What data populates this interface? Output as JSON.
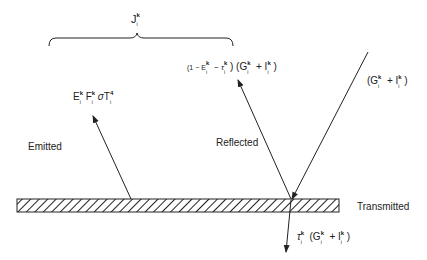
{
  "diagram": {
    "brace_label": {
      "base": "J",
      "sup": "k",
      "sub": "i"
    },
    "labels": {
      "emitted": "Emitted",
      "reflected": "Reflected",
      "transmitted": "Transmitted"
    },
    "expressions": {
      "emitted": "E_i^k F_i^k σ T_i^4",
      "reflected": "(1 − E_i^k − τ_i^k) (G_i^k + I_i^k)",
      "incident": "(G_i^k + I_i^k)",
      "transmitted": "τ_i^k (G_i^k + I_i^k)"
    },
    "expression_parts": {
      "emitted": {
        "E": "E",
        "F": "F",
        "sigma": "σ",
        "T": "T",
        "sup_k": "k",
        "sub_i": "i",
        "sup_4": "4"
      },
      "reflected": {
        "open": "(1 − E",
        "minus_tau": " − τ",
        "close": ") (G",
        "plus_I": " + I",
        "end": ")"
      },
      "incident": {
        "open": "(G",
        "plus_I": " + I",
        "end": ")"
      },
      "transmitted": {
        "tau": "τ",
        "open": " (G",
        "plus_I": " + I",
        "end": ")"
      }
    },
    "colors": {
      "line": "#222222",
      "background": "#ffffff"
    }
  }
}
